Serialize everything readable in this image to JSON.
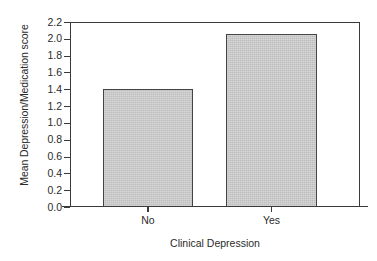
{
  "chart_data": {
    "type": "bar",
    "title": "",
    "subtitle": "",
    "categories": [
      "No",
      "Yes"
    ],
    "values": [
      1.4,
      2.06
    ],
    "series": [
      {
        "name": "Mean Depression/Medication score",
        "values": [
          1.4,
          2.06
        ]
      }
    ],
    "xlabel": "Clinical Depression",
    "ylabel": "Mean Depression/Medication score",
    "ylim": [
      0.0,
      2.2
    ],
    "ytick_step": 0.2,
    "ytick_labels": [
      "2.2",
      "2.0",
      "1.8",
      "1.6",
      "1.4",
      "1.2",
      "1.0",
      "0.8",
      "0.6",
      "0.4",
      "0.2",
      "0.0"
    ],
    "ytick_values": [
      2.2,
      2.0,
      1.8,
      1.6,
      1.4,
      1.2,
      1.0,
      0.8,
      0.6,
      0.4,
      0.2,
      0.0
    ],
    "grid": false,
    "legend": false,
    "legend_position": "none",
    "bar_fill_color": "#c9c9c9",
    "bar_edge_color": "#444444",
    "axis_color": "#3a3a3a",
    "background_color": "#ffffff",
    "annotations": []
  }
}
